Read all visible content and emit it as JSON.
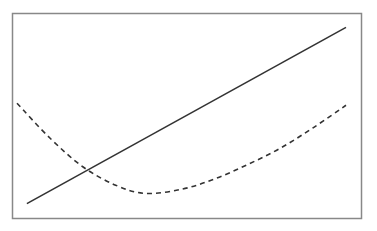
{
  "chart_data": {
    "type": "line",
    "title": "",
    "xlabel": "",
    "ylabel": "",
    "xlim": [
      0,
      1
    ],
    "ylim": [
      0,
      1
    ],
    "grid": false,
    "legend": null,
    "axes_ticks_visible": false,
    "series": [
      {
        "name": "linear",
        "style": "solid",
        "color": "#333333",
        "x": [
          0.03,
          1.0
        ],
        "y": [
          0.07,
          0.93
        ]
      },
      {
        "name": "quadratic",
        "style": "dashed",
        "color": "#333333",
        "x": [
          0.0,
          0.1,
          0.2,
          0.3,
          0.39,
          0.5,
          0.6,
          0.7,
          0.8,
          0.9,
          1.0
        ],
        "y": [
          0.56,
          0.39,
          0.25,
          0.16,
          0.12,
          0.14,
          0.19,
          0.26,
          0.34,
          0.44,
          0.55
        ]
      }
    ],
    "annotations": [
      {
        "type": "intersection",
        "x": 0.2,
        "y": 0.24
      }
    ]
  },
  "style": {
    "frame_color": "#888888",
    "line_color": "#333333",
    "background": "#ffffff"
  }
}
